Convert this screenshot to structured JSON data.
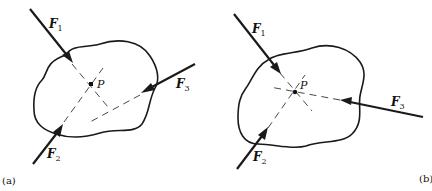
{
  "figure": {
    "panels": [
      {
        "id": "a",
        "caption": "(a)",
        "point_label": "P",
        "forces": [
          {
            "name": "F",
            "sub": "1"
          },
          {
            "name": "F",
            "sub": "2"
          },
          {
            "name": "F",
            "sub": "3"
          }
        ]
      },
      {
        "id": "b",
        "caption": "(b)",
        "point_label": "P",
        "forces": [
          {
            "name": "F",
            "sub": "1"
          },
          {
            "name": "F",
            "sub": "2"
          },
          {
            "name": "F",
            "sub": "3"
          }
        ]
      }
    ],
    "colors": {
      "ink": "#1a1a1a",
      "background": "#ffffff"
    }
  }
}
